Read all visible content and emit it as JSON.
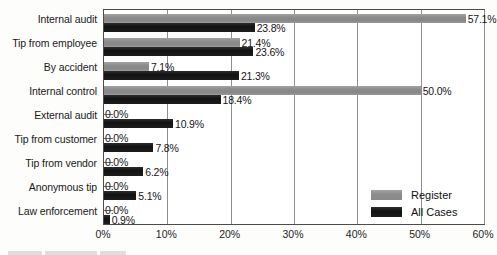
{
  "chart_data": {
    "type": "bar",
    "orientation": "horizontal",
    "title": "",
    "subtitle": "",
    "xlabel": "",
    "ylabel": "",
    "xlim": [
      0,
      60
    ],
    "grid": true,
    "gridlines_axis": "x",
    "legend_position": "inside-bottom-right",
    "value_suffix": "%",
    "categories": [
      "Internal audit",
      "Tip from employee",
      "By accident",
      "Internal control",
      "External audit",
      "Tip from customer",
      "Tip from vendor",
      "Anonymous tip",
      "Law enforcement"
    ],
    "series": [
      {
        "name": "Register",
        "color": "#8d8d8d",
        "values": [
          57.1,
          21.4,
          7.1,
          50.0,
          0.0,
          0.0,
          0.0,
          0.0,
          0.0
        ],
        "labels": [
          "57.1%",
          "21.4%",
          "7.1%",
          "50.0%",
          "0.0%",
          "0.0%",
          "0.0%",
          "0.0%",
          "0.0%"
        ]
      },
      {
        "name": "All Cases",
        "color": "#171717",
        "values": [
          23.8,
          23.6,
          21.3,
          18.4,
          10.9,
          7.8,
          6.2,
          5.1,
          0.9
        ],
        "labels": [
          "23.8%",
          "23.6%",
          "21.3%",
          "18.4%",
          "10.9%",
          "7.8%",
          "6.2%",
          "5.1%",
          "0.9%"
        ]
      }
    ],
    "xticks": [
      0,
      10,
      20,
      30,
      40,
      50,
      60
    ],
    "xtick_labels": [
      "0%",
      "10%",
      "20%",
      "30%",
      "40%",
      "50%",
      "60%"
    ]
  },
  "legend": {
    "entries": [
      {
        "label": "Register",
        "swatch": "register-swatch"
      },
      {
        "label": "All Cases",
        "swatch": "all-cases-swatch"
      }
    ]
  },
  "footer": {
    "caption_fragment": ""
  }
}
